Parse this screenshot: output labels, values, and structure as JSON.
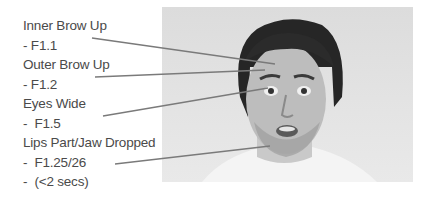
{
  "annotations": [
    {
      "label": "Inner Brow Up",
      "code": "- F1.1"
    },
    {
      "label": "Outer Brow Up",
      "code": "- F1.2"
    },
    {
      "label": "Eyes Wide",
      "code": "-  F1.5"
    },
    {
      "label": "Lips Part/Jaw Dropped",
      "code": "-  F1.25/26",
      "note": "-  (<2 secs)"
    }
  ],
  "colors": {
    "text": "#4a4a4a",
    "leader_line": "#7a7a7a",
    "photo_background": "#e2e2e2"
  },
  "photo": {
    "description": "grayscale portrait of a surprised young man with dark hair and stubble, white t-shirt"
  }
}
